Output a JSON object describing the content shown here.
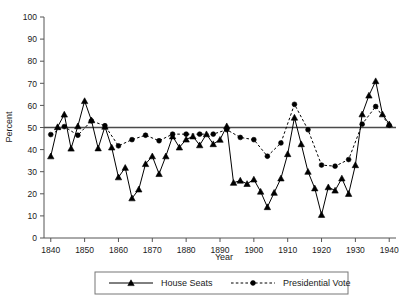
{
  "chart_data": {
    "type": "line",
    "title": "",
    "xlabel": "Year",
    "ylabel": "Percent",
    "xlim": [
      1838,
      1942
    ],
    "ylim": [
      0,
      100
    ],
    "yticks": [
      0,
      10,
      20,
      30,
      40,
      50,
      60,
      70,
      80,
      90,
      100
    ],
    "xticks": [
      1840,
      1850,
      1860,
      1870,
      1880,
      1890,
      1900,
      1910,
      1920,
      1930,
      1940
    ],
    "grid": false,
    "legend_position": "bottom",
    "reference_line": {
      "value": 50,
      "orientation": "horizontal",
      "label": "50"
    },
    "series": [
      {
        "name": "House Seats",
        "marker": "triangle",
        "linestyle": "solid",
        "color": "#000000",
        "points": [
          [
            1840,
            37.0
          ],
          [
            1842,
            50.2
          ],
          [
            1844,
            55.9
          ],
          [
            1846,
            40.5
          ],
          [
            1848,
            50.6
          ],
          [
            1850,
            62.0
          ],
          [
            1852,
            53.3
          ],
          [
            1854,
            40.6
          ],
          [
            1856,
            50.4
          ],
          [
            1858,
            41.0
          ],
          [
            1860,
            27.5
          ],
          [
            1862,
            31.8
          ],
          [
            1864,
            18.0
          ],
          [
            1866,
            22.0
          ],
          [
            1868,
            33.5
          ],
          [
            1870,
            37.0
          ],
          [
            1872,
            29.0
          ],
          [
            1874,
            37.0
          ],
          [
            1876,
            46.0
          ],
          [
            1878,
            41.0
          ],
          [
            1880,
            44.6
          ],
          [
            1882,
            46.0
          ],
          [
            1884,
            42.0
          ],
          [
            1886,
            47.0
          ],
          [
            1888,
            42.5
          ],
          [
            1890,
            44.5
          ],
          [
            1892,
            50.6
          ],
          [
            1894,
            25.0
          ],
          [
            1896,
            26.0
          ],
          [
            1898,
            24.5
          ],
          [
            1900,
            26.5
          ],
          [
            1902,
            21.0
          ],
          [
            1904,
            14.0
          ],
          [
            1906,
            20.5
          ],
          [
            1908,
            27.0
          ],
          [
            1910,
            38.0
          ],
          [
            1912,
            54.5
          ],
          [
            1914,
            42.5
          ],
          [
            1916,
            30.0
          ],
          [
            1918,
            22.5
          ],
          [
            1920,
            10.5
          ],
          [
            1922,
            23.0
          ],
          [
            1924,
            21.5
          ],
          [
            1926,
            27.0
          ],
          [
            1928,
            20.0
          ],
          [
            1930,
            33.0
          ],
          [
            1932,
            56.0
          ],
          [
            1934,
            64.5
          ],
          [
            1936,
            71.0
          ],
          [
            1938,
            56.0
          ],
          [
            1940,
            51.5
          ]
        ]
      },
      {
        "name": "Presidential Vote",
        "marker": "circle",
        "linestyle": "dashed",
        "color": "#000000",
        "points": [
          [
            1840,
            46.8
          ],
          [
            1844,
            50.4
          ],
          [
            1848,
            46.5
          ],
          [
            1852,
            53.0
          ],
          [
            1856,
            50.8
          ],
          [
            1860,
            41.7
          ],
          [
            1864,
            44.5
          ],
          [
            1868,
            46.5
          ],
          [
            1872,
            44.0
          ],
          [
            1876,
            47.0
          ],
          [
            1880,
            47.0
          ],
          [
            1884,
            47.0
          ],
          [
            1888,
            47.0
          ],
          [
            1892,
            49.0
          ],
          [
            1896,
            45.5
          ],
          [
            1900,
            44.5
          ],
          [
            1904,
            37.0
          ],
          [
            1908,
            43.0
          ],
          [
            1912,
            60.5
          ],
          [
            1916,
            49.0
          ],
          [
            1920,
            33.0
          ],
          [
            1924,
            32.5
          ],
          [
            1928,
            35.5
          ],
          [
            1932,
            51.5
          ],
          [
            1936,
            59.5
          ],
          [
            1940,
            51.0
          ]
        ]
      }
    ]
  },
  "legend": {
    "items": [
      {
        "label": "House Seats",
        "marker": "triangle",
        "linestyle": "solid"
      },
      {
        "label": "Presidential Vote",
        "marker": "circle",
        "linestyle": "dashed"
      }
    ]
  }
}
